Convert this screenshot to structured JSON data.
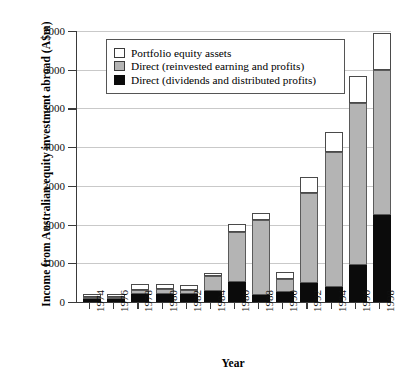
{
  "chart_data": {
    "type": "bar",
    "stacked": true,
    "title": "",
    "xlabel": "Year",
    "ylabel": "Income from Australian equity investment abroad (A$m)",
    "categories": [
      "1974",
      "1976",
      "1978",
      "1980",
      "1982",
      "1984",
      "1986",
      "1988",
      "1990",
      "1992",
      "1994",
      "1996",
      "1998"
    ],
    "ylim": [
      0,
      7000
    ],
    "ytick_labels": [
      "0",
      "1000",
      "2000",
      "3000",
      "4000",
      "5000",
      "6000",
      "7000"
    ],
    "ytick_values": [
      0,
      1000,
      2000,
      3000,
      4000,
      5000,
      6000,
      7000
    ],
    "grid": "horizontal",
    "legend_position": "upper-left-inside",
    "series": [
      {
        "name": "Direct (dividends and distributed profits)",
        "color": "#0b0b0b",
        "values": [
          75,
          70,
          215,
          205,
          195,
          295,
          510,
          170,
          265,
          500,
          390,
          950,
          2250
        ]
      },
      {
        "name": "Direct (reinvested earning and profits)",
        "color": "#b4b4b4",
        "values": [
          50,
          55,
          100,
          130,
          115,
          380,
          1310,
          1940,
          325,
          2310,
          3490,
          4190,
          3750
        ]
      },
      {
        "name": "Portfolio equity assets",
        "color": "#ffffff",
        "values": [
          75,
          80,
          145,
          125,
          120,
          65,
          190,
          190,
          190,
          410,
          500,
          700,
          940
        ]
      }
    ],
    "totals": [
      200,
      205,
      460,
      460,
      430,
      740,
      2010,
      2300,
      780,
      3220,
      4380,
      5840,
      6940
    ]
  },
  "legend": {
    "items": [
      {
        "label": "Portfolio equity assets",
        "swatch": "white"
      },
      {
        "label": "Direct (reinvested earning and profits)",
        "swatch": "gray"
      },
      {
        "label": "Direct (dividends and distributed profits)",
        "swatch": "black"
      }
    ]
  }
}
